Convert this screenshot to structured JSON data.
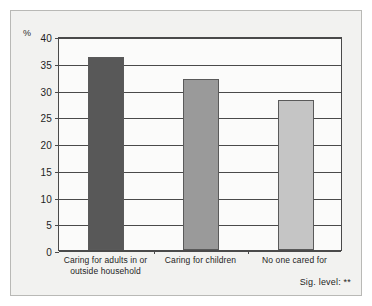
{
  "chart_data": {
    "type": "bar",
    "title": "",
    "xlabel": "",
    "ylabel": "%",
    "ylim": [
      0,
      40
    ],
    "ytick_step": 5,
    "grid": true,
    "legend": false,
    "categories": [
      "Caring for adults in or outside household",
      "Caring for children",
      "No one cared for"
    ],
    "category_lines": [
      [
        "Caring for adults in or",
        "outside household"
      ],
      [
        "Caring for children"
      ],
      [
        "No one cared for"
      ]
    ],
    "values": [
      36,
      32,
      28
    ],
    "ytick_labels": [
      "0",
      "5",
      "10",
      "15",
      "20",
      "25",
      "30",
      "35",
      "40"
    ],
    "bar_colors": [
      "#585858",
      "#9a9a9a",
      "#c5c5c5"
    ],
    "annotation": "Sig. level: **"
  },
  "colors": {
    "frame": "#4a4a4a",
    "outer_border": "#b9b9b6",
    "background": "#f2f2f0",
    "plot_background": "#fbfbfa",
    "text": "#1e1e1e"
  }
}
